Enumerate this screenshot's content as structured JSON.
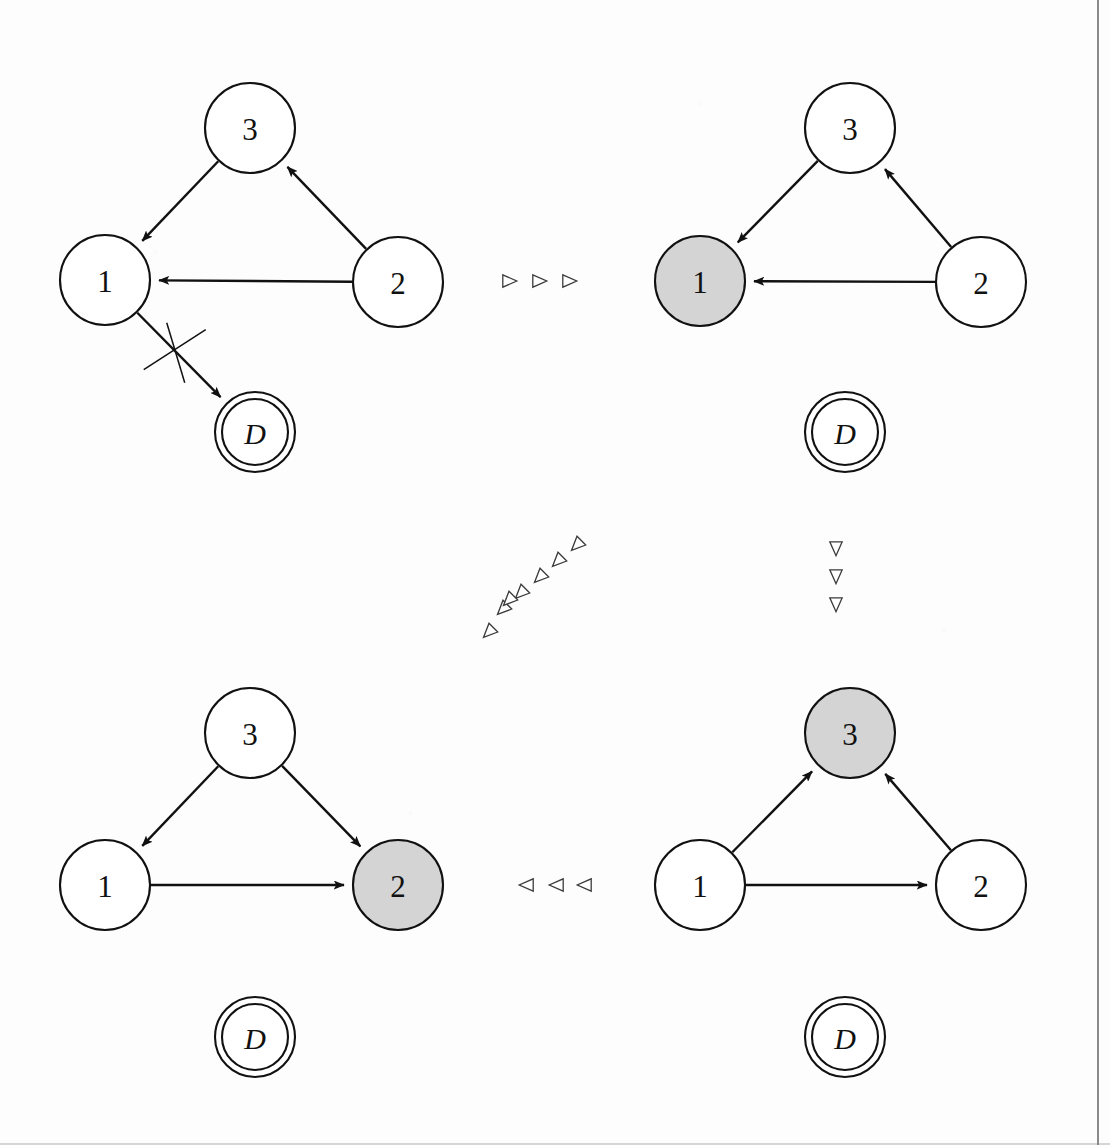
{
  "figure": {
    "kind": "state-transition-diagram",
    "panel_count": 4,
    "node_radius": 45,
    "accept_outer_radius": 40,
    "accept_inner_radius": 33,
    "colors": {
      "stroke": "#111111",
      "page_background": "#fdfdfd",
      "node_fill_plain": "#ffffff",
      "node_fill_highlight": "#d4d4d4",
      "marker_stroke": "#3a3a3a",
      "page_edge": "#8a8a8a"
    }
  },
  "panels": [
    {
      "id": "panel-top-left",
      "name": "initial-state-edge-removed",
      "origin": {
        "x": 0,
        "y": 0
      },
      "nodes": [
        {
          "id": "n3",
          "label": "3",
          "cx": 250,
          "cy": 128,
          "r": 45,
          "shape": "circle",
          "highlighted": false,
          "italic": false
        },
        {
          "id": "n1",
          "label": "1",
          "cx": 105,
          "cy": 280,
          "r": 45,
          "shape": "circle",
          "highlighted": false,
          "italic": false
        },
        {
          "id": "n2",
          "label": "2",
          "cx": 398,
          "cy": 282,
          "r": 45,
          "shape": "circle",
          "highlighted": false,
          "italic": false
        },
        {
          "id": "nD",
          "label": "D",
          "cx": 255,
          "cy": 432,
          "r": 40,
          "shape": "double-circle",
          "highlighted": false,
          "italic": true
        }
      ],
      "edges": [
        {
          "id": "e-3-1",
          "from": "n3",
          "to": "n1",
          "arrow": true,
          "crossed_out": false
        },
        {
          "id": "e-2-3",
          "from": "n2",
          "to": "n3",
          "arrow": true,
          "crossed_out": false
        },
        {
          "id": "e-2-1",
          "from": "n2",
          "to": "n1",
          "arrow": true,
          "crossed_out": false
        },
        {
          "id": "e-1-D",
          "from": "n1",
          "to": "nD",
          "arrow": true,
          "crossed_out": true
        }
      ]
    },
    {
      "id": "panel-top-right",
      "name": "node-1-highlighted",
      "origin": {
        "x": 600,
        "y": 0
      },
      "nodes": [
        {
          "id": "n3",
          "label": "3",
          "cx": 850,
          "cy": 128,
          "r": 45,
          "shape": "circle",
          "highlighted": false,
          "italic": false
        },
        {
          "id": "n1",
          "label": "1",
          "cx": 700,
          "cy": 281,
          "r": 45,
          "shape": "circle",
          "highlighted": true,
          "italic": false
        },
        {
          "id": "n2",
          "label": "2",
          "cx": 981,
          "cy": 282,
          "r": 45,
          "shape": "circle",
          "highlighted": false,
          "italic": false
        },
        {
          "id": "nD",
          "label": "D",
          "cx": 845,
          "cy": 432,
          "r": 40,
          "shape": "double-circle",
          "highlighted": false,
          "italic": true
        }
      ],
      "edges": [
        {
          "id": "e-3-1",
          "from": "n3",
          "to": "n1",
          "arrow": true,
          "crossed_out": false
        },
        {
          "id": "e-2-3",
          "from": "n2",
          "to": "n3",
          "arrow": true,
          "crossed_out": false
        },
        {
          "id": "e-2-1",
          "from": "n2",
          "to": "n1",
          "arrow": true,
          "crossed_out": false
        }
      ]
    },
    {
      "id": "panel-bottom-left",
      "name": "node-2-highlighted",
      "origin": {
        "x": 0,
        "y": 605
      },
      "nodes": [
        {
          "id": "n3",
          "label": "3",
          "cx": 250,
          "cy": 733,
          "r": 45,
          "shape": "circle",
          "highlighted": false,
          "italic": false
        },
        {
          "id": "n1",
          "label": "1",
          "cx": 105,
          "cy": 885,
          "r": 45,
          "shape": "circle",
          "highlighted": false,
          "italic": false
        },
        {
          "id": "n2",
          "label": "2",
          "cx": 398,
          "cy": 885,
          "r": 45,
          "shape": "circle",
          "highlighted": true,
          "italic": false
        },
        {
          "id": "nD",
          "label": "D",
          "cx": 255,
          "cy": 1037,
          "r": 40,
          "shape": "double-circle",
          "highlighted": false,
          "italic": true
        }
      ],
      "edges": [
        {
          "id": "e-3-1",
          "from": "n3",
          "to": "n1",
          "arrow": true,
          "crossed_out": false
        },
        {
          "id": "e-3-2",
          "from": "n3",
          "to": "n2",
          "arrow": true,
          "crossed_out": false
        },
        {
          "id": "e-1-2",
          "from": "n1",
          "to": "n2",
          "arrow": true,
          "crossed_out": false
        }
      ]
    },
    {
      "id": "panel-bottom-right",
      "name": "node-3-highlighted",
      "origin": {
        "x": 600,
        "y": 605
      },
      "nodes": [
        {
          "id": "n3",
          "label": "3",
          "cx": 850,
          "cy": 733,
          "r": 45,
          "shape": "circle",
          "highlighted": true,
          "italic": false
        },
        {
          "id": "n1",
          "label": "1",
          "cx": 700,
          "cy": 885,
          "r": 45,
          "shape": "circle",
          "highlighted": false,
          "italic": false
        },
        {
          "id": "n2",
          "label": "2",
          "cx": 981,
          "cy": 885,
          "r": 45,
          "shape": "circle",
          "highlighted": false,
          "italic": false
        },
        {
          "id": "nD",
          "label": "D",
          "cx": 845,
          "cy": 1037,
          "r": 40,
          "shape": "double-circle",
          "highlighted": false,
          "italic": true
        }
      ],
      "edges": [
        {
          "id": "e-1-3",
          "from": "n1",
          "to": "n3",
          "arrow": true,
          "crossed_out": false
        },
        {
          "id": "e-2-3",
          "from": "n2",
          "to": "n3",
          "arrow": true,
          "crossed_out": false
        },
        {
          "id": "e-1-2",
          "from": "n1",
          "to": "n2",
          "arrow": true,
          "crossed_out": false
        }
      ]
    }
  ],
  "transitions": [
    {
      "id": "transition-top",
      "name": "top-left-to-top-right",
      "direction": "right",
      "marker_count": 3,
      "markers": [
        {
          "x": 509,
          "y": 281
        },
        {
          "x": 539,
          "y": 281
        },
        {
          "x": 569,
          "y": 281
        }
      ]
    },
    {
      "id": "transition-diagonal",
      "name": "bottom-left-to-top-right",
      "direction": "down-left",
      "marker_count": 7,
      "markers": [
        {
          "x": 577,
          "y": 545
        },
        {
          "x": 558,
          "y": 561
        },
        {
          "x": 540,
          "y": 577
        },
        {
          "x": 521,
          "y": 593
        },
        {
          "x": 503,
          "y": 609
        },
        {
          "x": 509,
          "y": 600
        },
        {
          "x": 489,
          "y": 632
        }
      ]
    },
    {
      "id": "transition-right-vertical",
      "name": "top-right-to-bottom-right",
      "direction": "down",
      "marker_count": 3,
      "markers": [
        {
          "x": 836,
          "y": 548
        },
        {
          "x": 836,
          "y": 576
        },
        {
          "x": 836,
          "y": 604
        }
      ]
    },
    {
      "id": "transition-bottom",
      "name": "bottom-right-to-bottom-left",
      "direction": "left",
      "marker_count": 3,
      "markers": [
        {
          "x": 527,
          "y": 885
        },
        {
          "x": 557,
          "y": 885
        },
        {
          "x": 585,
          "y": 885
        }
      ]
    }
  ]
}
